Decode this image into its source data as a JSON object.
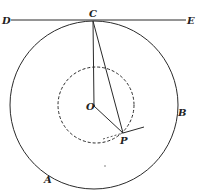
{
  "figure": {
    "labels": {
      "D": "D",
      "E": "E",
      "C": "C",
      "O": "O",
      "P": "P",
      "A": "A",
      "B": "B"
    },
    "colors": {
      "ink": "#2a2a2a",
      "background": "#ffffff"
    }
  }
}
